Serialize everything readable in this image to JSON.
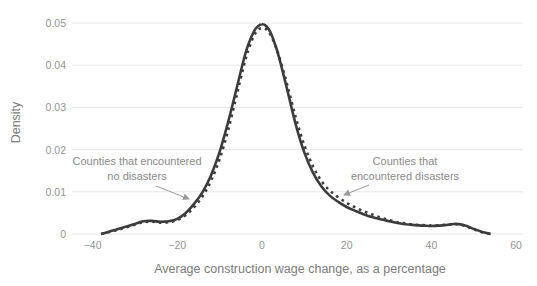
{
  "chart_data": {
    "type": "line",
    "xlabel": "Average construction wage change, as a percentage",
    "ylabel": "Density",
    "xlim": [
      -40,
      60
    ],
    "ylim": [
      0,
      0.05
    ],
    "x_ticks": [
      -40,
      -20,
      0,
      20,
      40,
      60
    ],
    "x_tick_labels": [
      "−40",
      "−20",
      "0",
      "20",
      "40",
      "60"
    ],
    "y_ticks": [
      0,
      0.01,
      0.02,
      0.03,
      0.04,
      0.05
    ],
    "y_tick_labels": [
      "0",
      "0.01",
      "0.02",
      "0.03",
      "0.04",
      "0.05"
    ],
    "grid": "horizontal",
    "legend_position": "in-plot annotations with arrows",
    "x": [
      -38,
      -36,
      -34,
      -32,
      -30,
      -28,
      -26,
      -24,
      -22,
      -20,
      -18,
      -16,
      -14,
      -12,
      -10,
      -8,
      -6,
      -4,
      -3,
      -2,
      -1,
      0,
      1,
      2,
      3,
      4,
      6,
      8,
      10,
      12,
      14,
      16,
      18,
      20,
      22,
      24,
      26,
      28,
      30,
      32,
      34,
      36,
      38,
      40,
      42,
      44,
      46,
      48,
      50,
      52,
      54
    ],
    "series": [
      {
        "name": "Counties that encountered no disasters",
        "line_style": "solid",
        "color": "#3c3c3c",
        "values": [
          0.0,
          0.0006,
          0.0012,
          0.0018,
          0.0024,
          0.003,
          0.0031,
          0.0029,
          0.003,
          0.0036,
          0.005,
          0.0072,
          0.01,
          0.014,
          0.0195,
          0.0265,
          0.0345,
          0.0425,
          0.0455,
          0.0478,
          0.0492,
          0.0497,
          0.0493,
          0.0478,
          0.0452,
          0.042,
          0.034,
          0.0258,
          0.0193,
          0.0146,
          0.0113,
          0.0091,
          0.0076,
          0.0064,
          0.0055,
          0.0047,
          0.004,
          0.0035,
          0.003,
          0.0026,
          0.0023,
          0.0021,
          0.002,
          0.0019,
          0.002,
          0.0022,
          0.0024,
          0.002,
          0.0012,
          0.0005,
          0.0
        ]
      },
      {
        "name": "Counties that encountered disasters",
        "line_style": "dashed",
        "color": "#3c3c3c",
        "values": [
          0.0,
          0.0005,
          0.001,
          0.0016,
          0.0022,
          0.0028,
          0.0029,
          0.0027,
          0.0028,
          0.0033,
          0.0045,
          0.0064,
          0.009,
          0.0127,
          0.0178,
          0.0246,
          0.0328,
          0.041,
          0.0442,
          0.0468,
          0.0483,
          0.0488,
          0.0485,
          0.0472,
          0.045,
          0.0422,
          0.0352,
          0.0275,
          0.021,
          0.0161,
          0.0126,
          0.0103,
          0.0087,
          0.0074,
          0.0063,
          0.0054,
          0.0046,
          0.0039,
          0.0033,
          0.0028,
          0.0025,
          0.0022,
          0.0021,
          0.002,
          0.0021,
          0.0022,
          0.0023,
          0.0019,
          0.0011,
          0.0004,
          0.0
        ]
      }
    ]
  },
  "annotations": {
    "no_disasters": {
      "line1": "Counties that encountered",
      "line2": "no disasters"
    },
    "disasters": {
      "line1": "Counties that",
      "line2": "encountered disasters"
    }
  },
  "colors": {
    "curve": "#3c3c3c",
    "gridline": "#e7e7e7",
    "tick_label": "#949494",
    "axis_label": "#7b7b7b",
    "annotation_text": "#8a8a8a",
    "arrow": "#9a9a9a",
    "background": "#ffffff"
  }
}
